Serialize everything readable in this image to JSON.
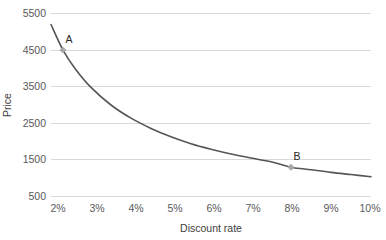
{
  "chart_data": {
    "type": "line",
    "title": "",
    "xlabel": "Discount rate",
    "ylabel": "Price",
    "xlim": [
      2,
      10
    ],
    "ylim": [
      500,
      5500
    ],
    "grid": true,
    "legend": false,
    "x_tick_labels": [
      "2%",
      "3%",
      "4%",
      "5%",
      "6%",
      "7%",
      "8%",
      "9%",
      "10%"
    ],
    "x_tick_values": [
      2,
      3,
      4,
      5,
      6,
      7,
      8,
      9,
      10
    ],
    "y_tick_labels": [
      "500",
      "1500",
      "2500",
      "3500",
      "4500",
      "5500"
    ],
    "y_tick_values": [
      500,
      1500,
      2500,
      3500,
      4500,
      5500
    ],
    "series": [
      {
        "name": "Price",
        "x": [
          2.0,
          2.3,
          2.6,
          3.0,
          3.5,
          4.0,
          4.5,
          5.0,
          5.5,
          6.0,
          6.5,
          7.0,
          7.5,
          8.0,
          8.5,
          9.0,
          9.5,
          10.0
        ],
        "values": [
          5200,
          4500,
          4000,
          3480,
          3000,
          2640,
          2360,
          2130,
          1940,
          1790,
          1660,
          1550,
          1450,
          1300,
          1230,
          1160,
          1100,
          1040
        ]
      }
    ],
    "annotations": [
      {
        "label": "A",
        "x": 2.3,
        "y": 4500
      },
      {
        "label": "B",
        "x": 8.0,
        "y": 1300
      }
    ],
    "colors": {
      "line": "#555555",
      "marker": "#a6a6a6",
      "grid": "#d9d9d9",
      "text": "#595959",
      "background": "#ffffff"
    }
  }
}
